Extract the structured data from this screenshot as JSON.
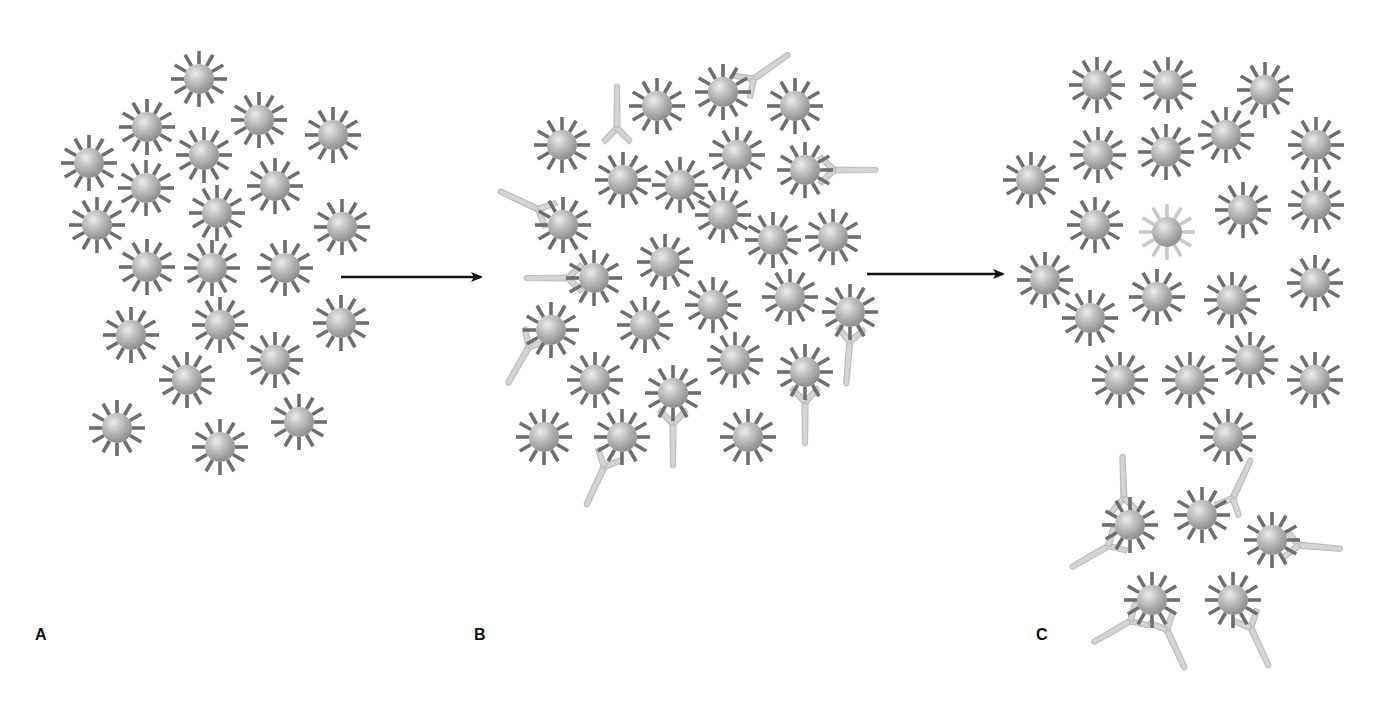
{
  "figure": {
    "colors": {
      "background": "#ffffff",
      "particle_core": "#b9b9b9",
      "particle_core_highlight": "#e4e4e4",
      "particle_core_shadow": "#8f8f8f",
      "particle_spike": "#6e6e6e",
      "particle_spike_faded": "#c8c8c8",
      "antibody_fill": "#d4d4d4",
      "antibody_stroke": "#bdbdbd",
      "arrow": "#111111",
      "label": "#111111"
    },
    "particle": {
      "core_radius": 14,
      "spike_inner": 15,
      "spike_outer": 28,
      "spike_count": 12,
      "spike_width": 3.6
    }
  },
  "panels": [
    {
      "id": "A",
      "label": "A",
      "label_pos": [
        35,
        640
      ],
      "particles": [
        [
          199,
          79
        ],
        [
          147,
          127
        ],
        [
          259,
          120
        ],
        [
          333,
          135
        ],
        [
          89,
          163
        ],
        [
          204,
          155
        ],
        [
          146,
          188
        ],
        [
          275,
          186
        ],
        [
          97,
          225
        ],
        [
          217,
          213
        ],
        [
          342,
          227
        ],
        [
          147,
          267
        ],
        [
          212,
          268
        ],
        [
          285,
          268
        ],
        [
          131,
          335
        ],
        [
          220,
          325
        ],
        [
          341,
          323
        ],
        [
          275,
          360
        ],
        [
          187,
          380
        ],
        [
          117,
          428
        ],
        [
          220,
          447
        ],
        [
          299,
          422
        ]
      ],
      "antibodies": []
    },
    {
      "id": "B",
      "label": "B",
      "label_pos": [
        474,
        640
      ],
      "particles": [
        [
          562,
          145
        ],
        [
          657,
          106
        ],
        [
          723,
          92
        ],
        [
          795,
          106
        ],
        [
          623,
          180
        ],
        [
          680,
          185
        ],
        [
          737,
          155
        ],
        [
          805,
          170
        ],
        [
          563,
          225
        ],
        [
          723,
          215
        ],
        [
          773,
          240
        ],
        [
          833,
          237
        ],
        [
          594,
          278
        ],
        [
          665,
          262
        ],
        [
          713,
          305
        ],
        [
          790,
          297
        ],
        [
          850,
          312
        ],
        [
          551,
          330
        ],
        [
          645,
          325
        ],
        [
          735,
          360
        ],
        [
          805,
          372
        ],
        [
          595,
          380
        ],
        [
          673,
          393
        ],
        [
          544,
          437
        ],
        [
          622,
          437
        ],
        [
          748,
          437
        ]
      ],
      "antibodies": [
        {
          "x": 617,
          "y": 130,
          "angle": -90
        },
        {
          "x": 752,
          "y": 80,
          "angle": -35
        },
        {
          "x": 832,
          "y": 170,
          "angle": 0
        },
        {
          "x": 540,
          "y": 210,
          "angle": -155
        },
        {
          "x": 570,
          "y": 278,
          "angle": 180
        },
        {
          "x": 530,
          "y": 345,
          "angle": 120
        },
        {
          "x": 850,
          "y": 340,
          "angle": 95
        },
        {
          "x": 805,
          "y": 400,
          "angle": 90
        },
        {
          "x": 673,
          "y": 422,
          "angle": 90
        },
        {
          "x": 605,
          "y": 465,
          "angle": 115
        }
      ]
    },
    {
      "id": "C",
      "label": "C",
      "label_pos": [
        1036,
        640
      ],
      "particles": [
        [
          1097,
          85
        ],
        [
          1168,
          85
        ],
        [
          1265,
          90
        ],
        [
          1031,
          180
        ],
        [
          1098,
          155
        ],
        [
          1166,
          152
        ],
        [
          1226,
          135
        ],
        [
          1316,
          145
        ],
        [
          1095,
          225
        ],
        [
          1243,
          210
        ],
        [
          1316,
          205
        ],
        [
          1045,
          280
        ],
        [
          1090,
          318
        ],
        [
          1157,
          297
        ],
        [
          1232,
          300
        ],
        [
          1315,
          283
        ],
        [
          1250,
          360
        ],
        [
          1120,
          380
        ],
        [
          1190,
          380
        ],
        [
          1315,
          380
        ],
        [
          1228,
          437
        ],
        [
          1130,
          525
        ],
        [
          1202,
          515
        ],
        [
          1272,
          540
        ],
        [
          1152,
          600
        ],
        [
          1233,
          600
        ]
      ],
      "faded_particles": [
        [
          1167,
          232
        ]
      ],
      "antibodies": [
        {
          "x": 1124,
          "y": 500,
          "angle": -92
        },
        {
          "x": 1110,
          "y": 545,
          "angle": 150
        },
        {
          "x": 1232,
          "y": 500,
          "angle": -65
        },
        {
          "x": 1297,
          "y": 545,
          "angle": 5
        },
        {
          "x": 1132,
          "y": 620,
          "angle": 150
        },
        {
          "x": 1166,
          "y": 628,
          "angle": 65
        },
        {
          "x": 1250,
          "y": 626,
          "angle": 65
        }
      ]
    }
  ],
  "arrows": [
    {
      "id": "arrow-a-to-b",
      "x1": 341,
      "y1": 277,
      "x2": 483,
      "y2": 277
    },
    {
      "id": "arrow-b-to-c",
      "x1": 867,
      "y1": 274,
      "x2": 1005,
      "y2": 274
    }
  ]
}
